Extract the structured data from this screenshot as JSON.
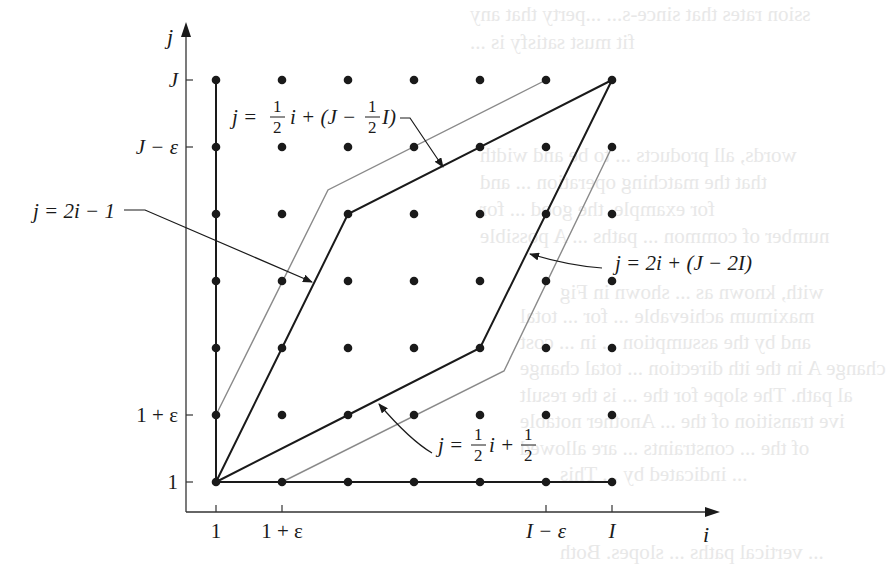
{
  "figure": {
    "axes": {
      "x_label": "i",
      "y_label": "j",
      "x_ticks": [
        {
          "label": "1",
          "col": 0
        },
        {
          "label": "1 + ε",
          "col": 1
        },
        {
          "label": "I − ε",
          "col": 5
        },
        {
          "label": "I",
          "col": 6
        }
      ],
      "y_ticks": [
        {
          "label": "J",
          "row": 6
        },
        {
          "label": "J − ε",
          "row": 5
        },
        {
          "label": "1 + ε",
          "row": 1
        },
        {
          "label": "1",
          "row": 0
        }
      ]
    },
    "grid": {
      "cols": 7,
      "rows": 7,
      "x0": 216,
      "dx": 66,
      "y0": 482,
      "dy": -67
    },
    "dark_paths": [
      [
        [
          0,
          0
        ],
        [
          2,
          1
        ],
        [
          4,
          2
        ],
        [
          6,
          6
        ]
      ],
      [
        [
          0,
          0
        ],
        [
          1,
          2
        ],
        [
          2,
          4
        ],
        [
          6,
          6
        ]
      ],
      [
        [
          0,
          6
        ],
        [
          0,
          0
        ],
        [
          6,
          0
        ]
      ]
    ],
    "gray_paths": [
      [
        [
          216,
          415
        ],
        [
          328,
          190
        ],
        [
          546,
          80
        ]
      ],
      [
        [
          282,
          482
        ],
        [
          504,
          371
        ],
        [
          612,
          147
        ]
      ]
    ],
    "labels": {
      "upper_line": {
        "prefix": "j = ",
        "frac": "1/2",
        "mid": " i + (J − ",
        "frac2": "1/2",
        "suffix": " I)"
      },
      "steep_lower": "j = 2i − 1",
      "steep_upper": "j = 2i + (J − 2I)",
      "shallow_lower": {
        "prefix": "j = ",
        "frac": "1/2",
        "mid": "i + ",
        "frac2": "1/2"
      }
    },
    "colors": {
      "ink": "#1a1a1a",
      "gray_line": "#8a8a8a",
      "bleed_text": "#e6e6e6"
    }
  },
  "bleed_text": [
    {
      "text": "ssion rates that since-s... ...perty that any",
      "x": 470,
      "y": 2
    },
    {
      "text": "fit must satisfy is ...",
      "x": 470,
      "y": 30
    },
    {
      "text": "words, all products ... to be and width",
      "x": 480,
      "y": 143
    },
    {
      "text": "that the matching operation ... and",
      "x": 480,
      "y": 170
    },
    {
      "text": "for example, the good ... for",
      "x": 480,
      "y": 197
    },
    {
      "text": "number of common ... paths ... A possible",
      "x": 480,
      "y": 224
    },
    {
      "text": "with, known as ... shown in Fig",
      "x": 560,
      "y": 280
    },
    {
      "text": "maximum achievable ... for ... total",
      "x": 520,
      "y": 304
    },
    {
      "text": "and by the assumption ... in ... cost",
      "x": 520,
      "y": 330
    },
    {
      "text": "change A in the ith direction ... total change",
      "x": 520,
      "y": 356
    },
    {
      "text": "al path. The slope for the ... is the result",
      "x": 520,
      "y": 383
    },
    {
      "text": "ive transition of the ... Another notable",
      "x": 520,
      "y": 409
    },
    {
      "text": "of the ... constraints ... are allowed",
      "x": 520,
      "y": 436
    },
    {
      "text": "... indicated by ... This",
      "x": 560,
      "y": 462
    },
    {
      "text": "... vertical paths ... slopes. Both",
      "x": 560,
      "y": 540
    }
  ]
}
